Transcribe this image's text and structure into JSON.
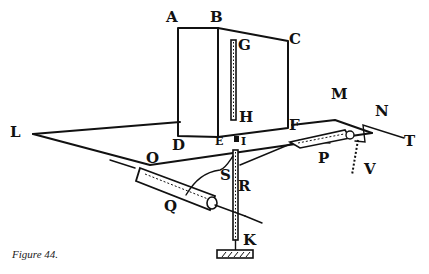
{
  "figure": {
    "caption": "Figure 44.",
    "labels": {
      "A": "A",
      "B": "B",
      "C": "C",
      "D": "D",
      "E": "E",
      "F": "F",
      "G": "G",
      "H": "H",
      "I": "I",
      "K": "K",
      "L": "L",
      "M": "M",
      "N": "N",
      "O": "O",
      "P": "P",
      "Q": "Q",
      "R": "R",
      "S": "S",
      "T": "T",
      "V": "V"
    },
    "parts": [
      "box ABCF",
      "plane LMN",
      "rod GH",
      "rod IK",
      "roller Q",
      "roller P",
      "dotted line V",
      "bent wire T"
    ]
  }
}
